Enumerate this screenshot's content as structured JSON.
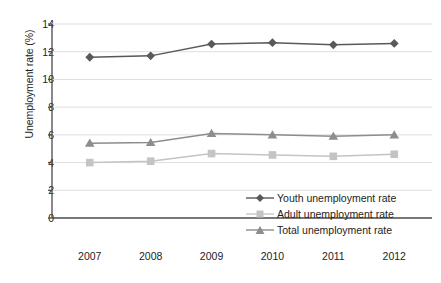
{
  "chart_data": {
    "type": "line",
    "title": "",
    "xlabel": "",
    "ylabel": "Unemployment rate (%)",
    "categories": [
      "2007",
      "2008",
      "2009",
      "2010",
      "2011",
      "2012"
    ],
    "x": [
      2007,
      2008,
      2009,
      2010,
      2011,
      2012
    ],
    "ylim": [
      0,
      14
    ],
    "yticks": [
      0,
      2,
      4,
      6,
      8,
      10,
      12,
      14
    ],
    "ytick_labels": [
      "0",
      "2",
      "4",
      "6",
      "8",
      "10",
      "12",
      "14"
    ],
    "grid": "horizontal",
    "legend_position": "inside-bottom-right",
    "series": [
      {
        "name": "Youth unemployment rate",
        "marker": "diamond",
        "color": "#595959",
        "values": [
          11.6,
          11.7,
          12.55,
          12.65,
          12.5,
          12.6
        ]
      },
      {
        "name": "Adult unemployment rate",
        "marker": "square",
        "color": "#c4c4c4",
        "values": [
          4.0,
          4.1,
          4.65,
          4.55,
          4.45,
          4.6
        ]
      },
      {
        "name": "Total unemployment rate",
        "marker": "triangle",
        "color": "#8d8d8d",
        "values": [
          5.4,
          5.45,
          6.1,
          6.0,
          5.9,
          6.0
        ]
      }
    ]
  },
  "legend": {
    "items": [
      {
        "label": "Youth unemployment rate"
      },
      {
        "label": "Adult unemployment rate"
      },
      {
        "label": "Total unemployment rate"
      }
    ]
  },
  "colors": {
    "youth": "#595959",
    "adult": "#c4c4c4",
    "total": "#8d8d8d",
    "axis": "#4a4a4a",
    "grid": "#dedede",
    "text": "#1d1d1d",
    "background": "#ffffff"
  }
}
